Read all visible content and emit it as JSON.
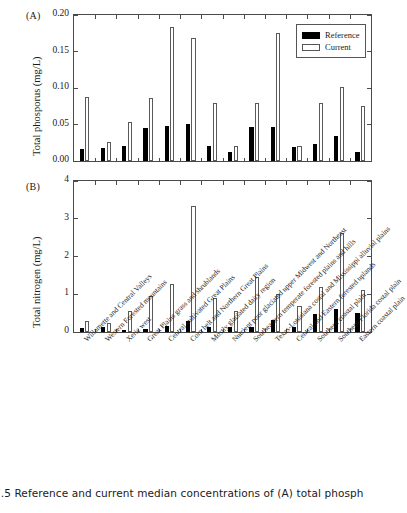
{
  "figure": {
    "caption": "7.5 Reference and current median concentrations of (A) total phosph",
    "panelA_label": "(A)",
    "panelB_label": "(B)"
  },
  "legend": {
    "position": "top-right",
    "items": [
      {
        "label": "Reference",
        "color": "#000000",
        "style": "filled"
      },
      {
        "label": "Current",
        "color": "#ffffff",
        "style": "outline"
      }
    ]
  },
  "chart_data": [
    {
      "type": "bar",
      "panel": "A",
      "title": "",
      "xlabel": "",
      "ylabel": "Total phosporus (mg/L)",
      "ylim": [
        0,
        0.2
      ],
      "yticks": [
        0.0,
        0.05,
        0.1,
        0.15,
        0.2
      ],
      "ytick_labels": [
        "0.00",
        "0.05",
        "0.10",
        "0.15",
        "0.20"
      ],
      "grid": false,
      "categories": [
        "Willamette and Central Valleys",
        "Western Forested mountains",
        "Xeric west",
        "Great Plains grass and shrublands",
        "Central cultivated Great Plains",
        "Corn belt and Northern Great Plains",
        "Mostly glaciated dairy region",
        "Nutrient poor glaciated upper Midwest and Northeast",
        "Southeastern temperate forested plains and hills",
        "Texas-Louisiana costal and Mississippi alluvial plains",
        "Central and Eastern forested uplands",
        "Southern coastal plain",
        "Southern Florida costal plain",
        "Eastern coastal plain"
      ],
      "series": [
        {
          "name": "Reference",
          "values": [
            0.016,
            0.018,
            0.02,
            0.045,
            0.048,
            0.051,
            0.021,
            0.012,
            0.047,
            0.047,
            0.019,
            0.023,
            0.034,
            0.013
          ]
        },
        {
          "name": "Current",
          "values": [
            0.088,
            0.026,
            0.054,
            0.087,
            0.184,
            0.168,
            0.079,
            0.02,
            0.079,
            0.176,
            0.021,
            0.079,
            0.102,
            0.076
          ]
        }
      ]
    },
    {
      "type": "bar",
      "panel": "B",
      "title": "",
      "xlabel": "",
      "ylabel": "Total nitrogen (mg/L)",
      "ylim": [
        0,
        4
      ],
      "yticks": [
        0,
        1,
        2,
        3,
        4
      ],
      "ytick_labels": [
        "0",
        "1",
        "2",
        "3",
        "4"
      ],
      "grid": false,
      "categories": [
        "Willamette and Central Valleys",
        "Western Forested mountains",
        "Xeric west",
        "Great Plains grass and shrublands",
        "Central cultivated Great Plains",
        "Corn belt and Northern Great Plains",
        "Mostly glaciated dairy region",
        "Nutrient poor glaciated upper Midwest and Northeast",
        "Southeastern temperate forested plains and hills",
        "Texas-Louisiana costal and Mississippi alluvial plains",
        "Central and Eastern forested uplands",
        "Southern coastal plain",
        "Southern Florida costal plain",
        "Eastern coastal plain"
      ],
      "series": [
        {
          "name": "Reference",
          "values": [
            0.11,
            0.13,
            0.04,
            0.08,
            0.17,
            0.29,
            0.12,
            0.12,
            0.12,
            0.32,
            0.12,
            0.49,
            0.6,
            0.51
          ]
        },
        {
          "name": "Current",
          "values": [
            0.29,
            0.23,
            0.56,
            0.95,
            1.26,
            3.35,
            0.91,
            0.55,
            1.45,
            1.0,
            0.69,
            1.18,
            2.63,
            1.11
          ]
        }
      ]
    }
  ],
  "xaxis_labels": [
    "Willamette and Central Valleys",
    "Western Forested mountains",
    "Xeric west",
    "Great Plains grass and shrublands",
    "Central cultivated Great Plains",
    "Corn belt and Northern Great Plains",
    "Mostly glaciated dairy region",
    "Nutrient poor glaciated upper Midwest and Northeast",
    "Southeastern temperate forested plains and hills",
    "Texas-Louisiana costal and Mississippi alluvial plains",
    "Central and Eastern forested uplands",
    "Southern coastal plain",
    "Southern Florida costal plain",
    "Eastern coastal plain"
  ]
}
